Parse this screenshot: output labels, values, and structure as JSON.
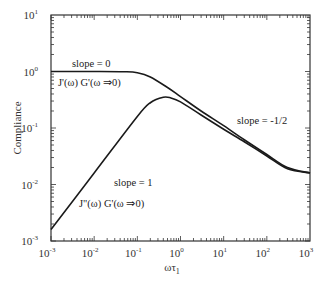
{
  "chart_data": {
    "type": "line",
    "title": "",
    "xlabel": "ωτ1",
    "ylabel": "Compliance",
    "xscale": "log",
    "yscale": "log",
    "xlim": [
      0.001,
      1000
    ],
    "ylim": [
      0.001,
      10
    ],
    "grid": false,
    "legend": null,
    "x_ticks": [
      {
        "base": "10",
        "exp": "-3",
        "value": 0.001
      },
      {
        "base": "10",
        "exp": "-2",
        "value": 0.01
      },
      {
        "base": "10",
        "exp": "-1",
        "value": 0.1
      },
      {
        "base": "10",
        "exp": "0",
        "value": 1
      },
      {
        "base": "10",
        "exp": "1",
        "value": 10
      },
      {
        "base": "10",
        "exp": "2",
        "value": 100
      },
      {
        "base": "10",
        "exp": "3",
        "value": 1000
      }
    ],
    "y_ticks": [
      {
        "base": "10",
        "exp": "1",
        "value": 10
      },
      {
        "base": "10",
        "exp": "0",
        "value": 1
      },
      {
        "base": "10",
        "exp": "-1",
        "value": 0.1
      },
      {
        "base": "10",
        "exp": "-2",
        "value": 0.01
      },
      {
        "base": "10",
        "exp": "-3",
        "value": 0.001
      }
    ],
    "series": [
      {
        "name": "J'(ω) G'(ω ⇒0)",
        "x": [
          0.001,
          0.01,
          0.05,
          0.1,
          0.2,
          0.5,
          1,
          3,
          10,
          30,
          100,
          300,
          1000
        ],
        "y": [
          1.0,
          1.0,
          0.99,
          0.95,
          0.8,
          0.52,
          0.36,
          0.2,
          0.11,
          0.062,
          0.034,
          0.02,
          0.016
        ]
      },
      {
        "name": "J\"(ω) G'(ω ⇒0)",
        "x": [
          0.001,
          0.01,
          0.1,
          0.2,
          0.4,
          0.6,
          1,
          3,
          10,
          30,
          100,
          300,
          1000
        ],
        "y": [
          0.0016,
          0.016,
          0.16,
          0.28,
          0.35,
          0.34,
          0.29,
          0.17,
          0.095,
          0.057,
          0.032,
          0.019,
          0.016
        ]
      }
    ],
    "annotations": [
      {
        "text": "slope = 0",
        "x": 0.006,
        "y": 1.3
      },
      {
        "text": "J'(ω) G'(ω ⇒0)",
        "x": 0.006,
        "y": 0.7
      },
      {
        "text": "slope = -1/2",
        "x": 30,
        "y": 0.15
      },
      {
        "text": "slope = 1",
        "x": 0.05,
        "y": 0.01
      },
      {
        "text": "J\"(ω) G'(ω ⇒0)",
        "x": 0.03,
        "y": 0.005
      }
    ]
  },
  "labels": {
    "ylabel": "Compliance",
    "xlabel_main": "ωτ",
    "xlabel_sub": "1",
    "slope0": "slope = 0",
    "jprime": "J'(ω) G'(ω ⇒0)",
    "slope_half": "slope = -1/2",
    "slope1": "slope = 1",
    "jdprime": "J\"(ω) G'(ω ⇒0)"
  }
}
